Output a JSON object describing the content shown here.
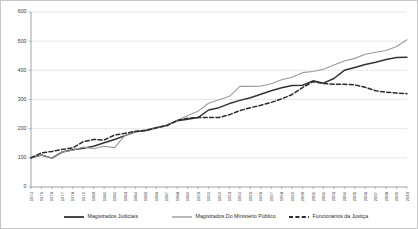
{
  "chart_data": {
    "type": "line",
    "title": "",
    "subtitle": "",
    "xlabel": "",
    "ylabel": "",
    "ylim": [
      0,
      600
    ],
    "yticks": [
      0,
      100,
      200,
      300,
      400,
      500,
      600
    ],
    "grid": true,
    "legend_position": "bottom",
    "categories": [
      "1974",
      "1975",
      "1976",
      "1977",
      "1978",
      "1979",
      "1980",
      "1981",
      "1982",
      "1983",
      "1984",
      "1985",
      "1986",
      "1987",
      "1988",
      "1989",
      "1990",
      "1991",
      "1992",
      "1993",
      "1994",
      "1995",
      "1996",
      "1997",
      "1998",
      "1999",
      "2000",
      "2001",
      "2002",
      "2003",
      "2004",
      "2005",
      "2006",
      "2007",
      "2008",
      "2009",
      "2010"
    ],
    "series": [
      {
        "name": "Magistrados Judiciais",
        "style": "solid",
        "color": "#333333",
        "width": 1.5,
        "values": [
          100,
          110,
          99,
          120,
          128,
          133,
          140,
          152,
          163,
          176,
          189,
          194,
          203,
          212,
          227,
          232,
          238,
          264,
          272,
          286,
          297,
          306,
          318,
          330,
          340,
          348,
          349,
          364,
          356,
          372,
          400,
          410,
          420,
          428,
          437,
          444,
          445
        ]
      },
      {
        "name": "Magistrados Do Ministério Público",
        "style": "solid",
        "color": "#9a9a9a",
        "width": 1.1,
        "values": [
          100,
          110,
          99,
          120,
          126,
          137,
          131,
          140,
          135,
          177,
          190,
          196,
          204,
          211,
          228,
          245,
          260,
          287,
          299,
          311,
          345,
          345,
          346,
          354,
          368,
          376,
          392,
          396,
          404,
          418,
          432,
          441,
          455,
          462,
          468,
          482,
          505
        ]
      },
      {
        "name": "Funcionários da Justiça",
        "style": "dashed",
        "color": "#2b2b2b",
        "width": 1.5,
        "values": [
          100,
          117,
          122,
          129,
          134,
          155,
          163,
          161,
          178,
          184,
          191,
          194,
          203,
          210,
          228,
          236,
          238,
          238,
          238,
          248,
          262,
          272,
          280,
          290,
          302,
          317,
          341,
          361,
          355,
          352,
          352,
          350,
          342,
          330,
          325,
          322,
          320
        ]
      }
    ]
  },
  "legend": {
    "items": [
      {
        "label": "Magistrados Judiciais"
      },
      {
        "label": "Magistrados Do Ministério Público"
      },
      {
        "label": "Funcionários da Justiça"
      }
    ]
  }
}
